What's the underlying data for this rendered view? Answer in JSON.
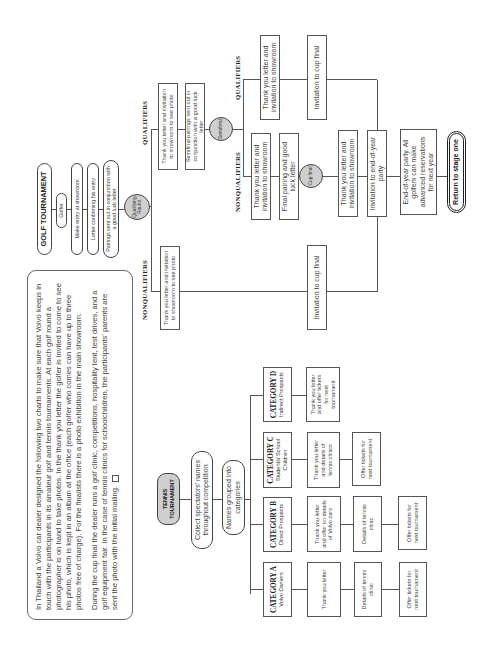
{
  "intro_text": {
    "paragraph_1": "In Thailand a Volvo car dealer designed the following two charts to make sure that Volvo keeps in touch with the participants in its amateur golf and tennis tournaments. At each golf round a photographer is on hand to take photos. In the thank you letter the golfer is invited to come to see his photo, which is kept in an album at the office (each golfer who comes can have up to three photos free of charge). For the finalists there is a photo exhibition in the main showroom.",
    "paragraph_2": "During the cup final the dealer runs a golf clinic, competitions, hospitality tent, test drives, and a golf equipment fair. In the case of tennis clinics for schoolchildren, the participants' parents are sent the photo with the initial mailing.",
    "end_icon": "square-end-mark-icon"
  },
  "golf": {
    "title": "GOLF TOURNAMENT",
    "steps": [
      "Golfer",
      "Make entry at showroom",
      "Letter confirming his entry",
      "Pairings sent out in conjunction with a good luck letter"
    ],
    "qualifying_round": "Qualifying Round",
    "qualifiers_label": "QUALIFIERS",
    "nonqualifiers_label": "NONQUALIFIERS",
    "qualifiers_1": {
      "steps": [
        "Thank you letter and invitation to showroom to see photo",
        "Semifinal pairings sent out in conjunction with a good luck letter"
      ],
      "semifinal": "Semifinal"
    },
    "nonqualifiers_1": {
      "steps": [
        "Thank you letter and invitation to showroom to see photo",
        "Invitation to cup final"
      ]
    },
    "qualifiers_2": {
      "steps": [
        "Thank you letter and invitation to showroom",
        "Invitation to cup final"
      ]
    },
    "nonqualifiers_2": {
      "steps": [
        "Thank you letter and invitation to showroom",
        "Final pairing and good luck letter"
      ],
      "cup_final": "Cup final",
      "after_final": [
        "Thank you letter and invitation to showroom",
        "Invitation to end-of-year party",
        "End-of-year party. All golfers can make advanced reservations for next year"
      ],
      "return": "Return to stage one"
    }
  },
  "tennis": {
    "title": "TENNIS TOURNAMENT",
    "steps": [
      "Collect spectators' names throughout competition",
      "Names grouped into categories"
    ],
    "categories": [
      {
        "name": "CATEGORY A",
        "subtitle": "Volvo Owners",
        "steps": [
          "Thank you letter",
          "Details of tennis clinic",
          "Offer tickets for next tournament"
        ]
      },
      {
        "name": "CATEGORY B",
        "subtitle": "Direct Prospects",
        "steps": [
          "Thank you letter and offer on details of Volvo cars",
          "Details of tennis clinic",
          "Offer tickets for next tournament"
        ]
      },
      {
        "name": "CATEGORY C",
        "subtitle": "Students/ School Children",
        "steps": [
          "Thank you letter and details of tennis clinics",
          "Offer tickets for next tournament"
        ]
      },
      {
        "name": "CATEGORY D",
        "subtitle": "Indirect Prospects",
        "steps": [
          "Thank you letter and offer tickets for next tournament"
        ]
      }
    ]
  }
}
